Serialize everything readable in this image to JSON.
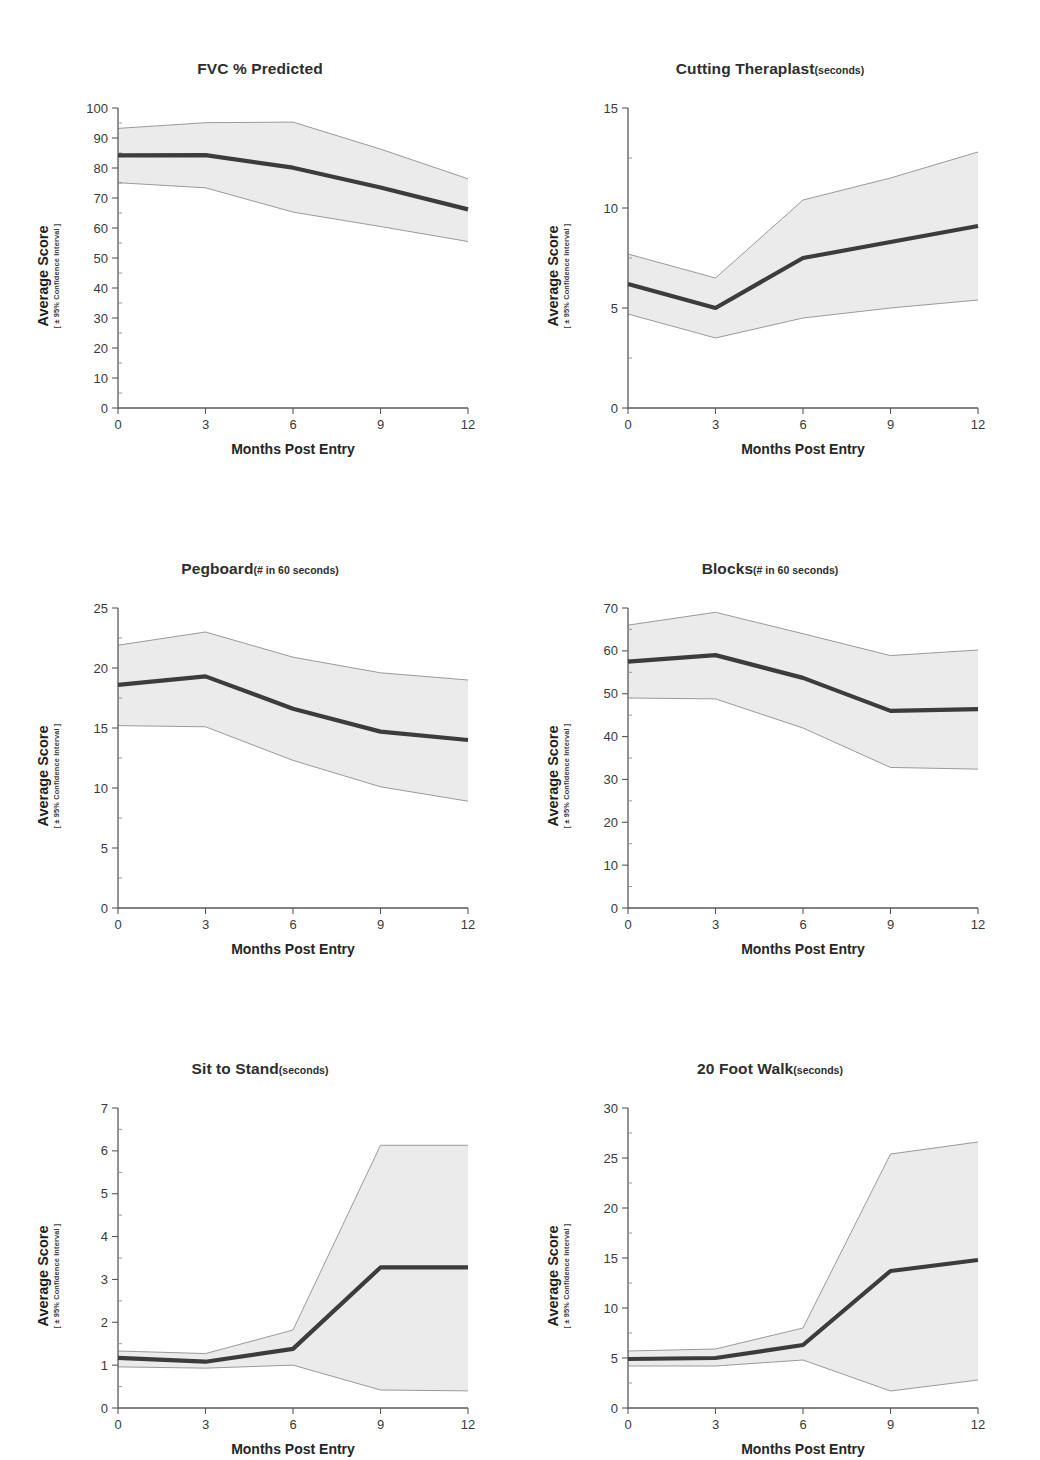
{
  "figure": {
    "y_axis_label_main": "Average Score",
    "y_axis_label_sub": "[ ± 95% Confidence Interval ]",
    "x_axis_label": "Months Post Entry",
    "band_color": "#ebebeb",
    "line_color": "#3c3c3c",
    "edge_color": "#9a9a9a"
  },
  "chart_data": [
    {
      "type": "line",
      "title": "FVC % Predicted",
      "title_unit": "",
      "xlabel": "Months Post Entry",
      "ylabel": "Average Score",
      "ylabel_sub": "[ ± 95% Confidence Interval ]",
      "x": [
        0,
        3,
        6,
        9,
        12
      ],
      "xticks": [
        0,
        3,
        6,
        9,
        12
      ],
      "xticklabels": [
        "0",
        "3",
        "6",
        "9",
        "12"
      ],
      "yticks": [
        0,
        10,
        20,
        30,
        40,
        50,
        60,
        70,
        80,
        90,
        100
      ],
      "yticklabels": [
        "0",
        "10",
        "20",
        "30",
        "40",
        "50",
        "60",
        "70",
        "80",
        "90",
        "100"
      ],
      "xlim": [
        0,
        12
      ],
      "ylim": [
        0,
        100
      ],
      "grid": false,
      "legend": "none",
      "series": [
        {
          "name": "mean",
          "values": [
            84.2,
            84.3,
            80.1,
            73.5,
            66.2
          ]
        },
        {
          "name": "ci_upper",
          "values": [
            93.2,
            95.1,
            95.3,
            86.3,
            76.4
          ]
        },
        {
          "name": "ci_lower",
          "values": [
            75.1,
            73.4,
            65.3,
            60.5,
            55.5
          ]
        }
      ]
    },
    {
      "type": "line",
      "title": "Cutting Theraplast",
      "title_unit": "(seconds)",
      "xlabel": "Months Post Entry",
      "ylabel": "Average Score",
      "ylabel_sub": "[ ± 95% Confidence Interval ]",
      "x": [
        0,
        3,
        6,
        9,
        12
      ],
      "xticks": [
        0,
        3,
        6,
        9,
        12
      ],
      "xticklabels": [
        "0",
        "3",
        "6",
        "9",
        "12"
      ],
      "yticks": [
        0,
        5,
        10,
        15
      ],
      "yticklabels": [
        "0",
        "5",
        "10",
        "15"
      ],
      "xlim": [
        0,
        12
      ],
      "ylim": [
        0,
        15
      ],
      "grid": false,
      "legend": "none",
      "series": [
        {
          "name": "mean",
          "values": [
            6.2,
            5.0,
            7.5,
            8.3,
            9.1
          ]
        },
        {
          "name": "ci_upper",
          "values": [
            7.7,
            6.5,
            10.4,
            11.5,
            12.8
          ]
        },
        {
          "name": "ci_lower",
          "values": [
            4.7,
            3.5,
            4.5,
            5.0,
            5.4
          ]
        }
      ]
    },
    {
      "type": "line",
      "title": "Pegboard",
      "title_unit": "(# in 60 seconds)",
      "xlabel": "Months Post Entry",
      "ylabel": "Average Score",
      "ylabel_sub": "[ ± 95% Confidence Interval ]",
      "x": [
        0,
        3,
        6,
        9,
        12
      ],
      "xticks": [
        0,
        3,
        6,
        9,
        12
      ],
      "xticklabels": [
        "0",
        "3",
        "6",
        "9",
        "12"
      ],
      "yticks": [
        0,
        5,
        10,
        15,
        20,
        25
      ],
      "yticklabels": [
        "0",
        "5",
        "10",
        "15",
        "20",
        "25"
      ],
      "xlim": [
        0,
        12
      ],
      "ylim": [
        0,
        25
      ],
      "grid": false,
      "legend": "none",
      "series": [
        {
          "name": "mean",
          "values": [
            18.6,
            19.3,
            16.6,
            14.7,
            14.0
          ]
        },
        {
          "name": "ci_upper",
          "values": [
            21.9,
            23.0,
            20.9,
            19.6,
            19.0
          ]
        },
        {
          "name": "ci_lower",
          "values": [
            15.2,
            15.1,
            12.3,
            10.1,
            8.9
          ]
        }
      ]
    },
    {
      "type": "line",
      "title": "Blocks",
      "title_unit": "(# in 60 seconds)",
      "xlabel": "Months Post Entry",
      "ylabel": "Average Score",
      "ylabel_sub": "[ ± 95% Confidence Interval ]",
      "x": [
        0,
        3,
        6,
        9,
        12
      ],
      "xticks": [
        0,
        3,
        6,
        9,
        12
      ],
      "xticklabels": [
        "0",
        "3",
        "6",
        "9",
        "12"
      ],
      "yticks": [
        0,
        10,
        20,
        30,
        40,
        50,
        60,
        70
      ],
      "yticklabels": [
        "0",
        "10",
        "20",
        "30",
        "40",
        "50",
        "60",
        "70"
      ],
      "xlim": [
        0,
        12
      ],
      "ylim": [
        0,
        70
      ],
      "grid": false,
      "legend": "none",
      "series": [
        {
          "name": "mean",
          "values": [
            57.5,
            59.0,
            53.7,
            46.0,
            46.4
          ]
        },
        {
          "name": "ci_upper",
          "values": [
            66.0,
            69.0,
            64.0,
            58.9,
            60.2
          ]
        },
        {
          "name": "ci_lower",
          "values": [
            49.0,
            48.8,
            42.0,
            32.8,
            32.4
          ]
        }
      ]
    },
    {
      "type": "line",
      "title": "Sit to Stand",
      "title_unit": "(seconds)",
      "xlabel": "Months Post Entry",
      "ylabel": "Average Score",
      "ylabel_sub": "[ ± 95% Confidence Interval ]",
      "x": [
        0,
        3,
        6,
        9,
        12
      ],
      "xticks": [
        0,
        3,
        6,
        9,
        12
      ],
      "xticklabels": [
        "0",
        "3",
        "6",
        "9",
        "12"
      ],
      "yticks": [
        0,
        1,
        2,
        3,
        4,
        5,
        6,
        7
      ],
      "yticklabels": [
        "0",
        "1",
        "2",
        "3",
        "4",
        "5",
        "6",
        "7"
      ],
      "xlim": [
        0,
        12
      ],
      "ylim": [
        0,
        7
      ],
      "grid": false,
      "legend": "none",
      "series": [
        {
          "name": "mean",
          "values": [
            1.17,
            1.08,
            1.38,
            3.28,
            3.28
          ]
        },
        {
          "name": "ci_upper",
          "values": [
            1.33,
            1.27,
            1.82,
            6.13,
            6.13
          ]
        },
        {
          "name": "ci_lower",
          "values": [
            0.96,
            0.93,
            1.0,
            0.42,
            0.4
          ]
        }
      ]
    },
    {
      "type": "line",
      "title": "20 Foot Walk",
      "title_unit": "(seconds)",
      "xlabel": "Months Post Entry",
      "ylabel": "Average Score",
      "ylabel_sub": "[ ± 95% Confidence Interval ]",
      "x": [
        0,
        3,
        6,
        9,
        12
      ],
      "xticks": [
        0,
        3,
        6,
        9,
        12
      ],
      "xticklabels": [
        "0",
        "3",
        "6",
        "9",
        "12"
      ],
      "yticks": [
        0,
        5,
        10,
        15,
        20,
        25,
        30
      ],
      "yticklabels": [
        "0",
        "5",
        "10",
        "15",
        "20",
        "25",
        "30"
      ],
      "xlim": [
        0,
        30
      ],
      "ylim": [
        0,
        30
      ],
      "grid": false,
      "legend": "none",
      "series": [
        {
          "name": "mean",
          "values": [
            4.9,
            5.0,
            6.3,
            13.7,
            14.8
          ]
        },
        {
          "name": "ci_upper",
          "values": [
            5.7,
            5.9,
            8.0,
            25.4,
            26.6
          ]
        },
        {
          "name": "ci_lower",
          "values": [
            4.2,
            4.2,
            4.8,
            1.7,
            2.8
          ]
        }
      ]
    }
  ],
  "panels": [
    {
      "index": 0,
      "name": "fvc-percent-predicted"
    },
    {
      "index": 1,
      "name": "cutting-theraplast"
    },
    {
      "index": 2,
      "name": "pegboard"
    },
    {
      "index": 3,
      "name": "blocks"
    },
    {
      "index": 4,
      "name": "sit-to-stand"
    },
    {
      "index": 5,
      "name": "twenty-foot-walk"
    }
  ]
}
